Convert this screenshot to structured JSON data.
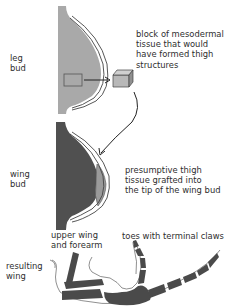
{
  "diagram": {
    "labels": {
      "leg_bud": "leg\nbud",
      "block_desc": "block of mesodermal\ntissue that would\nhave formed thigh\nstructures",
      "wing_bud": "wing\nbud",
      "graft_desc": "presumptive thigh\ntissue grafted into\nthe tip of the wing bud",
      "upper_wing": "upper wing\nand forearm",
      "toes": "toes with terminal claws",
      "resulting_wing": "resulting\nwing"
    },
    "colors": {
      "leg_bud_fill": "#a9a9a9",
      "wing_bud_fill": "#505050",
      "graft_fill": "#9a9a9a",
      "bone_fill": "#4a4a4a",
      "outline": "#333333",
      "background": "#ffffff"
    }
  }
}
